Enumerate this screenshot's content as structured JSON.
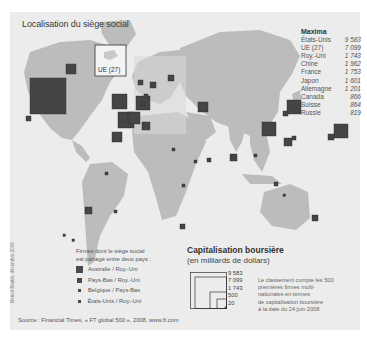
{
  "title": "Localisation du siège social",
  "ue_label": "UE (27)",
  "maxima": {
    "heading": "Maxima",
    "rows": [
      {
        "country": "États-Unis",
        "value": "9 583"
      },
      {
        "country": "UE (27)",
        "value": "7 099"
      },
      {
        "country": "Roy.-Uni",
        "value": "1 743"
      },
      {
        "country": "Chine",
        "value": "1 962"
      },
      {
        "country": "France",
        "value": "1 753"
      },
      {
        "country": "Japon",
        "value": "1 601"
      },
      {
        "country": "Allemagne",
        "value": "1 201"
      },
      {
        "country": "Canada",
        "value": "866"
      },
      {
        "country": "Suisse",
        "value": "864"
      },
      {
        "country": "Russie",
        "value": "819"
      }
    ]
  },
  "shared_legend": {
    "intro_line1": "Firmes dont le siège social",
    "intro_line2": "est partagé entre deux pays :",
    "items": [
      {
        "label": "Australie / Roy.-Uni",
        "size": 7
      },
      {
        "label": "Pays-Bas / Roy.-Uni",
        "size": 5
      },
      {
        "label": "Belgique / Pays-Bas",
        "size": 3
      },
      {
        "label": "États-Unis / Roy.-Uni",
        "size": 2.5
      }
    ]
  },
  "capitalisation": {
    "title": "Capitalisation boursière",
    "subtitle": "(en milliards de dollars)",
    "scale_values": [
      "9 583",
      "7 099",
      "1 743",
      "500",
      "20"
    ],
    "note_lines": [
      "Le classement compte les 500",
      "premières firmes multi-",
      "nationales en termes",
      "de capitalisation boursière",
      "à la date du 24 juin 2008."
    ]
  },
  "source": "Source : Financial Times, « FT global 500 », 2008, www.ft.com",
  "credit": "Benoît Martin, décembre 2008",
  "colors": {
    "land": "#b9b9b9",
    "land_highlight": "#a6a6a6",
    "ocean": "#ececec",
    "square": "#464646"
  }
}
